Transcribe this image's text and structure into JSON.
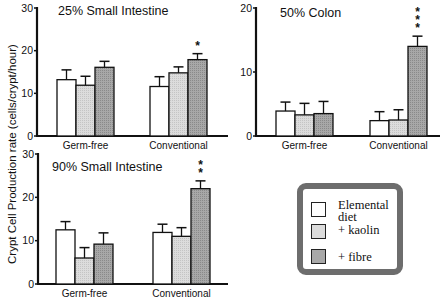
{
  "figure": {
    "y_axis_label": "Crypt Cell Production rate (cells/crypt/hour)",
    "legend": [
      {
        "label": "Elemental diet",
        "color": "#ffffff"
      },
      {
        "label": "+ kaolin",
        "color": "#dcdcdc"
      },
      {
        "label": "+ fibre",
        "color": "#a8a8a8"
      }
    ]
  },
  "chart_data": [
    {
      "type": "bar",
      "title": "25% Small Intestine",
      "categories": [
        "Germ-free",
        "Conventional"
      ],
      "series": [
        {
          "name": "Elemental diet",
          "values": [
            13.2,
            11.6
          ],
          "errors": [
            2.3,
            2.3
          ]
        },
        {
          "name": "+ kaolin",
          "values": [
            11.9,
            14.8
          ],
          "errors": [
            2.1,
            1.4
          ]
        },
        {
          "name": "+ fibre",
          "values": [
            16.1,
            17.9
          ],
          "errors": [
            1.4,
            1.4
          ]
        }
      ],
      "annotations": [
        {
          "category": "Conventional",
          "series": "+ fibre",
          "text": "*"
        }
      ],
      "xlabel": "",
      "ylabel": "Crypt Cell Production rate (cells/crypt/hour)",
      "ylim": [
        0,
        30
      ],
      "yticks": [
        0,
        10,
        20,
        30
      ],
      "grid": false
    },
    {
      "type": "bar",
      "title": "50% Colon",
      "categories": [
        "Germ-free",
        "Conventional"
      ],
      "series": [
        {
          "name": "Elemental diet",
          "values": [
            3.9,
            2.4
          ],
          "errors": [
            1.4,
            1.4
          ]
        },
        {
          "name": "+ kaolin",
          "values": [
            3.3,
            2.5
          ],
          "errors": [
            1.8,
            1.6
          ]
        },
        {
          "name": "+ fibre",
          "values": [
            3.5,
            14.0
          ],
          "errors": [
            1.9,
            1.6
          ]
        }
      ],
      "annotations": [
        {
          "category": "Conventional",
          "series": "+ fibre",
          "text": "***"
        }
      ],
      "xlabel": "",
      "ylabel": "",
      "ylim": [
        0,
        20
      ],
      "yticks": [
        0,
        10,
        20
      ],
      "grid": false
    },
    {
      "type": "bar",
      "title": "90% Small Intestine",
      "categories": [
        "Germ-free",
        "Conventional"
      ],
      "series": [
        {
          "name": "Elemental diet",
          "values": [
            12.5,
            11.9
          ],
          "errors": [
            1.9,
            1.9
          ]
        },
        {
          "name": "+ kaolin",
          "values": [
            6.0,
            11.0
          ],
          "errors": [
            2.4,
            2.0
          ]
        },
        {
          "name": "+ fibre",
          "values": [
            9.2,
            22.0
          ],
          "errors": [
            2.6,
            1.8
          ]
        }
      ],
      "annotations": [
        {
          "category": "Conventional",
          "series": "+ fibre",
          "text": "**"
        }
      ],
      "xlabel": "",
      "ylabel": "Crypt Cell Production rate (cells/crypt/hour)",
      "ylim": [
        0,
        30
      ],
      "yticks": [
        0,
        10,
        20,
        30
      ],
      "grid": false
    }
  ]
}
